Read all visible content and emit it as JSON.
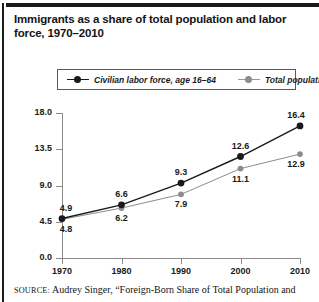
{
  "figure": {
    "title": "Immigrants as a share of total population and labor force, 1970–2010",
    "source_prefix": "SOURCE:",
    "source_text": " Audrey Singer, “Foreign-Born Share of Total Population and"
  },
  "legend": {
    "position": "top-inside",
    "entries": [
      {
        "label": "Civilian labor force, age 16–64",
        "color": "#1a1a1a"
      },
      {
        "label": "Total population",
        "color": "#8c8c8c"
      }
    ]
  },
  "chart_data": {
    "type": "line",
    "title": "Immigrants as a share of total population and labor force, 1970–2010",
    "xlabel": "",
    "ylabel": "",
    "x": [
      1970,
      1980,
      1990,
      2000,
      2010
    ],
    "xtick_labels": [
      "1970",
      "1980",
      "1990",
      "2000",
      "2010"
    ],
    "ytick_labels": [
      "0.0",
      "4.5",
      "9.0",
      "13.5",
      "18.0"
    ],
    "yticks": [
      0.0,
      4.5,
      9.0,
      13.5,
      18.0
    ],
    "ylim": [
      0.0,
      18.0
    ],
    "xlim": [
      1970,
      2010
    ],
    "grid": false,
    "series": [
      {
        "name": "Civilian labor force, age 16–64",
        "color": "#1a1a1a",
        "values": [
          4.9,
          6.6,
          9.3,
          12.6,
          16.4
        ],
        "labels": [
          "4.9",
          "6.6",
          "9.3",
          "12.6",
          "16.4"
        ],
        "label_position": "above"
      },
      {
        "name": "Total population",
        "color": "#8c8c8c",
        "values": [
          4.8,
          6.2,
          7.9,
          11.1,
          12.9
        ],
        "labels": [
          "4.8",
          "6.2",
          "7.9",
          "11.1",
          "12.9"
        ],
        "label_position": "below"
      }
    ]
  }
}
